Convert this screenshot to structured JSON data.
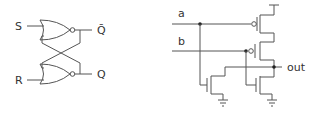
{
  "latch": {
    "inputs": {
      "s": "S",
      "r": "R"
    },
    "outputs": {
      "qbar": "Q̄",
      "q": "Q"
    }
  },
  "nor_cmos": {
    "inputs": {
      "a": "a",
      "b": "b"
    },
    "output": "out"
  },
  "colors": {
    "wire": "#555555",
    "label": "#333333",
    "background": "#ffffff"
  }
}
